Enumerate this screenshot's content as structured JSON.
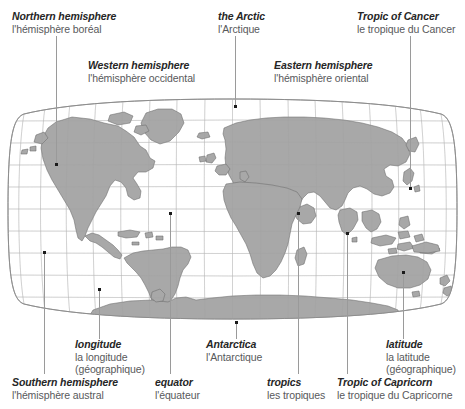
{
  "figure": {
    "title_visible": false,
    "map_type": "world-map-robinson-projection",
    "colors": {
      "land": "#a8a8a8",
      "land_stroke": "#6d6d6d",
      "graticule": "#c9c9c9",
      "outline": "#8a8a8a",
      "leader_line": "#9a9a9a",
      "dot": "#1a1a1a",
      "english_text": "#262626",
      "french_text": "#58595b",
      "background": "#ffffff"
    }
  },
  "callouts": [
    {
      "id": "northern-hemisphere",
      "en": "Northern hemisphere",
      "fr": "l'hémisphère boréal",
      "fr2": ""
    },
    {
      "id": "the-arctic",
      "en": "the Arctic",
      "fr": "l'Arctique",
      "fr2": ""
    },
    {
      "id": "tropic-of-cancer",
      "en": "Tropic of Cancer",
      "fr": "le tropique du Cancer",
      "fr2": ""
    },
    {
      "id": "western-hemisphere",
      "en": "Western hemisphere",
      "fr": "l'hémisphère occidental",
      "fr2": ""
    },
    {
      "id": "eastern-hemisphere",
      "en": "Eastern hemisphere",
      "fr": "l'hémisphère oriental",
      "fr2": ""
    },
    {
      "id": "longitude",
      "en": "longitude",
      "fr": "la longitude",
      "fr2": "(géographique)"
    },
    {
      "id": "antarctica",
      "en": "Antarctica",
      "fr": "l'Antarctique",
      "fr2": ""
    },
    {
      "id": "latitude",
      "en": "latitude",
      "fr": "la latitude",
      "fr2": "(géographique)"
    },
    {
      "id": "southern-hemisphere",
      "en": "Southern hemisphere",
      "fr": "l'hémisphère austral",
      "fr2": ""
    },
    {
      "id": "equator",
      "en": "equator",
      "fr": "l'équateur",
      "fr2": ""
    },
    {
      "id": "tropics",
      "en": "tropics",
      "fr": "les tropiques",
      "fr2": ""
    },
    {
      "id": "tropic-of-capricorn",
      "en": "Tropic of Capricorn",
      "fr": "le tropique du Capricorne",
      "fr2": ""
    }
  ]
}
